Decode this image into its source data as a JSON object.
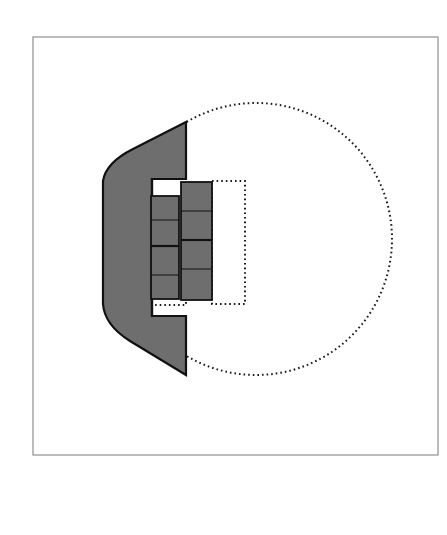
{
  "figure": {
    "title": "",
    "background_color": "#ffffff",
    "width": 447,
    "height": 535
  },
  "frame": {
    "label": "figure-border",
    "x": 33,
    "y": 37,
    "width": 405,
    "height": 418,
    "stroke_color": "#8f8f8f",
    "stroke_width": 1.2,
    "fill": "none"
  },
  "colors": {
    "gray_fill": "#6e6e6e",
    "outline_black": "#111111",
    "white": "#ffffff",
    "dotted": "#1a1a1a",
    "frame_gray": "#8f8f8f"
  },
  "shapes": {
    "solid_body": {
      "label": "gray-body-profile",
      "fill": "#6e6e6e",
      "stroke": "#111111",
      "stroke_width": 2.2,
      "path": "M 186 122 L 133 149 C 117 157 105 168 103 181 L 103 304 C 104 318 114 331 130 341 L 186 375 L 186 316 L 152 316 L 152 179 L 186 179 Z"
    },
    "white_bracket": {
      "label": "white-inner-bracket",
      "fill": "#ffffff",
      "stroke": "#111111",
      "stroke_width": 2.2,
      "path": "M 186 179 L 152 179 L 152 316 L 186 316"
    },
    "left_column": {
      "label": "left-segment-column",
      "x": 151,
      "y": 196,
      "width": 28,
      "height": 103,
      "fill": "#6e6e6e",
      "stroke": "#111111",
      "stroke_width": 1.8,
      "divider_positions": [
        220,
        246,
        275
      ],
      "divider_weights": [
        1.0,
        2.2,
        1.0
      ]
    },
    "right_column": {
      "label": "right-segment-column",
      "x": 181,
      "y": 182,
      "width": 31,
      "height": 118,
      "fill": "#6e6e6e",
      "stroke": "#111111",
      "stroke_width": 1.8,
      "divider_positions": [
        211,
        240,
        269
      ],
      "divider_weights": [
        1.0,
        2.2,
        1.0
      ]
    },
    "dotted_field": {
      "label": "dotted-notched-circle",
      "fill": "none",
      "stroke": "#1a1a1a",
      "stroke_width": 2.0,
      "dash": "1.6 3.0",
      "circle_center_x": 256,
      "circle_center_y": 239,
      "circle_radius": 136,
      "notch_x": 186,
      "notch_top_y": 175,
      "notch_bottom_y": 305
    },
    "dotted_inner_rect": {
      "label": "dotted-inner-rect",
      "x": 212,
      "y": 181,
      "width": 33,
      "height": 123,
      "fill": "none",
      "stroke": "#1a1a1a",
      "stroke_width": 2.0,
      "dash": "1.6 3.0"
    }
  },
  "annotations": {
    "text_labels": [],
    "legend": []
  }
}
